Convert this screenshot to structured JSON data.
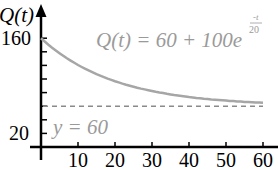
{
  "chart_data": {
    "type": "line",
    "title": "",
    "xlabel": "",
    "ylabel": "Q(t)",
    "equation_label": "Q(t) = 60 + 100e",
    "equation_exponent_num": "-t",
    "equation_exponent_den": "20",
    "asymptote_label": "y = 60",
    "asymptote_value": 60,
    "xlim": [
      0,
      65
    ],
    "ylim": [
      0,
      170
    ],
    "x_ticks": [
      10,
      20,
      30,
      40,
      50,
      60
    ],
    "x_tick_labels": [
      "10",
      "20",
      "30",
      "40",
      "50",
      "60"
    ],
    "y_ticks": [
      20,
      40,
      60,
      80,
      100,
      120,
      140,
      160
    ],
    "y_tick_labels_shown": [
      "160",
      "20"
    ],
    "grid": false,
    "series": [
      {
        "name": "Q(t) = 60 + 100e^(-t/20)",
        "x": [
          0,
          5,
          10,
          15,
          20,
          25,
          30,
          35,
          40,
          45,
          50,
          55,
          60
        ],
        "y": [
          160,
          137.9,
          120.7,
          107.2,
          96.8,
          88.7,
          82.3,
          77.4,
          73.5,
          70.5,
          68.2,
          66.4,
          65.0
        ]
      }
    ],
    "colors": {
      "curve": "#a6a6a6",
      "asymptote": "#8a8a8a",
      "axes": "#000000",
      "label_text": "#9a9a9a"
    }
  },
  "labels": {
    "y_axis_title": "Q(t)",
    "y_top": "160",
    "y_bottom": "20",
    "equation_main": "Q(t) = 60 + 100e",
    "equation_exp_num": "-t",
    "equation_exp_den": "20",
    "asymptote": "y = 60",
    "x_ticks": [
      "10",
      "20",
      "30",
      "40",
      "50",
      "60"
    ]
  }
}
